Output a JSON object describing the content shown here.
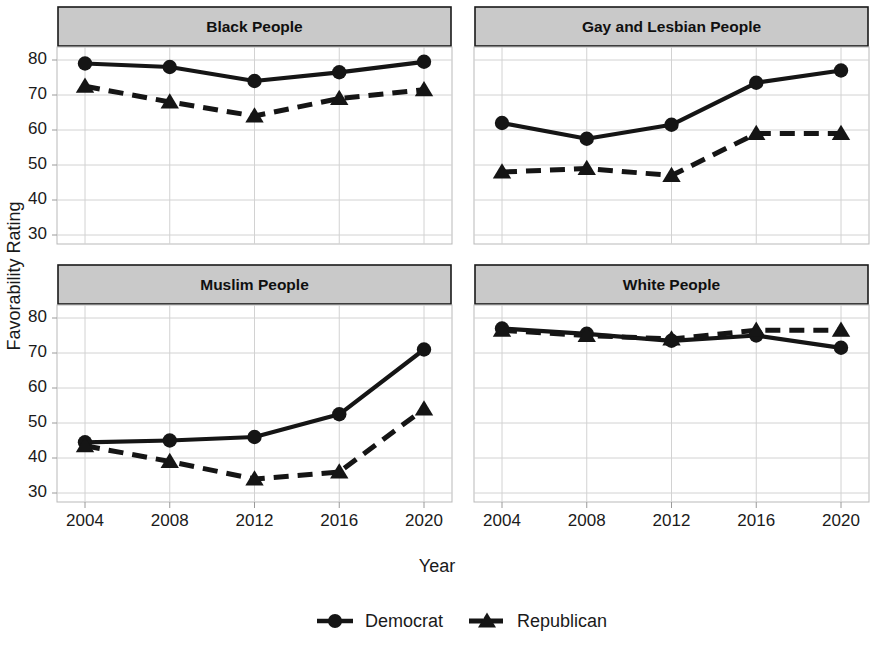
{
  "chart_data": {
    "type": "line",
    "title": "",
    "xlabel": "Year",
    "ylabel": "Favorability Rating",
    "x": [
      2004,
      2008,
      2012,
      2016,
      2020
    ],
    "xtick_labels": [
      "2004",
      "2008",
      "2012",
      "2016",
      "2020"
    ],
    "ytick_labels": [
      "80",
      "70",
      "60",
      "50",
      "40",
      "30"
    ],
    "yticks": [
      80,
      70,
      60,
      50,
      40,
      30
    ],
    "ylim": [
      28,
      82
    ],
    "xlim": [
      2003,
      2021
    ],
    "grid": true,
    "legend_position": "bottom",
    "facet_layout": "2x2",
    "legend": [
      {
        "name": "Democrat",
        "marker": "circle",
        "linestyle": "solid",
        "color": "#151515"
      },
      {
        "name": "Republican",
        "marker": "triangle",
        "linestyle": "dashed",
        "color": "#151515"
      }
    ],
    "panels": [
      {
        "title": "Black People",
        "series": [
          {
            "name": "Democrat",
            "values": [
              79,
              78,
              74,
              76.5,
              79.5
            ]
          },
          {
            "name": "Republican",
            "values": [
              72.5,
              68,
              64,
              69,
              71.5
            ]
          }
        ]
      },
      {
        "title": "Gay and Lesbian People",
        "series": [
          {
            "name": "Democrat",
            "values": [
              62,
              57.5,
              61.5,
              73.5,
              77
            ]
          },
          {
            "name": "Republican",
            "values": [
              48,
              49,
              47,
              59,
              59
            ]
          }
        ]
      },
      {
        "title": "Muslim People",
        "series": [
          {
            "name": "Democrat",
            "values": [
              44.5,
              45,
              46,
              52.5,
              71
            ]
          },
          {
            "name": "Republican",
            "values": [
              43.5,
              39,
              34,
              36,
              54
            ]
          }
        ]
      },
      {
        "title": "White People",
        "series": [
          {
            "name": "Democrat",
            "values": [
              77,
              75.5,
              73.5,
              75,
              71.5
            ]
          },
          {
            "name": "Republican",
            "values": [
              76.5,
              75,
              74,
              76.5,
              76.5
            ]
          }
        ]
      }
    ]
  },
  "colors": {
    "ink": "#151515",
    "strip_fill": "#c9c9c9",
    "strip_border": "#1a1a1a",
    "grid": "#d2d2d2",
    "background": "#ffffff"
  }
}
